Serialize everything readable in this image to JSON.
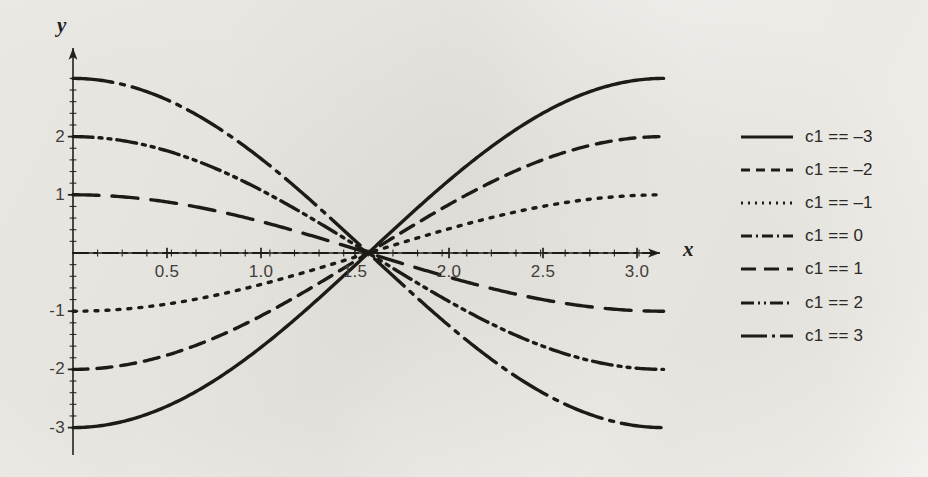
{
  "figure": {
    "y_axis_label": "y",
    "x_axis_label": "x"
  },
  "chart_data": {
    "type": "line",
    "title": "",
    "subtitle": "",
    "xlabel": "x",
    "ylabel": "y",
    "xlim": [
      0,
      3.14159
    ],
    "ylim": [
      -3.25,
      3.25
    ],
    "grid": false,
    "legend_position": "right",
    "x_ticks": [
      "0.5",
      "1.0",
      "1.5",
      "2.0",
      "2.5",
      "3.0"
    ],
    "x_tick_values": [
      0.5,
      1.0,
      1.5,
      2.0,
      2.5,
      3.0
    ],
    "y_ticks": [
      "2",
      "1",
      "-1",
      "-2",
      "-3"
    ],
    "y_tick_values": [
      2,
      1,
      -1,
      -2,
      -3
    ],
    "x_minor_tick_count": 24,
    "y_minor_tick_count": 30,
    "axes_style": "arrow-tipped crossing axes at origin",
    "formula": "y = c1 cos(x)",
    "x": [
      0,
      0.19635,
      0.3927,
      0.58905,
      0.7854,
      0.98175,
      1.1781,
      1.37445,
      1.5708,
      1.76715,
      1.9635,
      2.15985,
      2.3562,
      2.55255,
      2.7489,
      2.94525,
      3.14159
    ],
    "series": [
      {
        "name": "c1 == -3",
        "c1": -3,
        "line_style": "solid",
        "legend_dash": "none",
        "values": [
          -3,
          -2.943,
          -2.772,
          -2.495,
          -2.121,
          -1.667,
          -1.148,
          -0.585,
          0,
          0.585,
          1.148,
          1.667,
          2.121,
          2.495,
          2.772,
          2.943,
          3
        ]
      },
      {
        "name": "c1 == -2",
        "c1": -2,
        "line_style": "dashed",
        "legend_dash": "9 6",
        "values": [
          -2,
          -1.962,
          -1.848,
          -1.663,
          -1.414,
          -1.111,
          -0.765,
          -0.39,
          0,
          0.39,
          0.765,
          1.111,
          1.414,
          1.663,
          1.848,
          1.962,
          2
        ]
      },
      {
        "name": "c1 == -1",
        "c1": -1,
        "line_style": "dotted",
        "legend_dash": "2 5",
        "values": [
          -1,
          -0.981,
          -0.924,
          -0.831,
          -0.707,
          -0.556,
          -0.383,
          -0.195,
          0,
          0.195,
          0.383,
          0.556,
          0.707,
          0.831,
          0.924,
          0.981,
          1
        ]
      },
      {
        "name": "c1 == 0",
        "c1": 0,
        "line_style": "dash-dot",
        "legend_dash": "10 4 2 4",
        "values": [
          0,
          0,
          0,
          0,
          0,
          0,
          0,
          0,
          0,
          0,
          0,
          0,
          0,
          0,
          0,
          0,
          0
        ]
      },
      {
        "name": "c1 == 1",
        "c1": 1,
        "line_style": "long-dashed",
        "legend_dash": "15 7",
        "values": [
          1,
          0.981,
          0.924,
          0.831,
          0.707,
          0.556,
          0.383,
          0.195,
          0,
          -0.195,
          -0.383,
          -0.556,
          -0.707,
          -0.831,
          -0.924,
          -0.981,
          -1
        ]
      },
      {
        "name": "c1 == 2",
        "c1": 2,
        "line_style": "dash-dot-dot",
        "legend_dash": "13 4 2 4 2 4",
        "values": [
          2,
          1.962,
          1.848,
          1.663,
          1.414,
          1.111,
          0.765,
          0.39,
          0,
          -0.39,
          -0.765,
          -1.111,
          -1.414,
          -1.663,
          -1.848,
          -1.962,
          -2
        ]
      },
      {
        "name": "c1 == 3",
        "c1": 3,
        "line_style": "long-dash-dot",
        "legend_dash": "24 5 3 5",
        "values": [
          3,
          2.943,
          2.772,
          2.495,
          2.121,
          1.667,
          1.148,
          0.585,
          0,
          -0.585,
          -1.148,
          -1.667,
          -2.121,
          -2.495,
          -2.772,
          -2.943,
          -3
        ]
      }
    ]
  },
  "legend": {
    "items": [
      {
        "label": "c1 == –3",
        "dash": "none"
      },
      {
        "label": "c1 == –2",
        "dash": "9 6"
      },
      {
        "label": "c1 == –1",
        "dash": "2 5"
      },
      {
        "label": "c1 == 0",
        "dash": "11 4 2 4"
      },
      {
        "label": "c1 == 1",
        "dash": "15 8"
      },
      {
        "label": "c1 == 2",
        "dash": "13 4 2 4 2 4"
      },
      {
        "label": "c1 == 3",
        "dash": "26 5 3 5"
      }
    ]
  },
  "colors": {
    "ink": "#23211e",
    "paper": "#f7f6f3",
    "tick_text": "#403d39"
  }
}
